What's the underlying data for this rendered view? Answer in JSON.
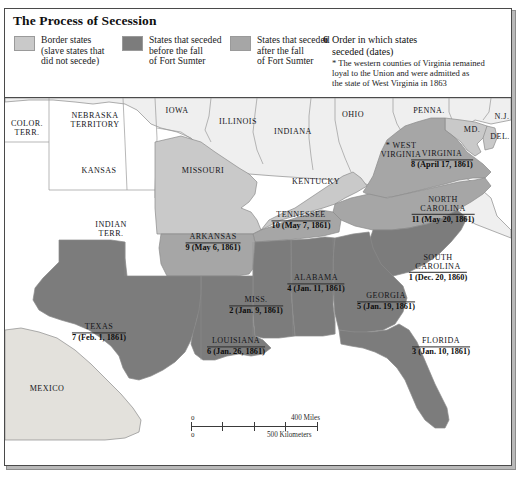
{
  "legend": {
    "title": "The Process of Secession",
    "items": [
      {
        "label": "Border states\n(slave states that\ndid not secede)",
        "color": "#c9c9c9",
        "swatch_name": "swatch-border-states"
      },
      {
        "label": "States that seceded\nbefore the fall\nof Fort Sumter",
        "color": "#7c7c7c",
        "swatch_name": "swatch-seceded-before"
      },
      {
        "label": "States that seceded\nafter the fall\nof Fort Sumter",
        "color": "#a6a6a6",
        "swatch_name": "swatch-seceded-after"
      }
    ],
    "note_number": "6",
    "note_text": "Order in which states\nseceded (dates)",
    "note_footnote": "* The western counties of Virginia remained\nloyal to the Union and were admitted as\nthe state of West Virginia in 1863"
  },
  "map": {
    "plain_labels": [
      {
        "name": "label-colorado-territory",
        "text": "COLOR.\nTERR.",
        "x": 22,
        "y": 30
      },
      {
        "name": "label-nebraska-territory",
        "text": "NEBRASKA\nTERRITORY",
        "x": 90,
        "y": 22
      },
      {
        "name": "label-kansas",
        "text": "KANSAS",
        "x": 94,
        "y": 73
      },
      {
        "name": "label-indian-territory",
        "text": "INDIAN\nTERR.",
        "x": 106,
        "y": 131
      },
      {
        "name": "label-iowa",
        "text": "IOWA",
        "x": 172,
        "y": 13
      },
      {
        "name": "label-illinois",
        "text": "ILLINOIS",
        "x": 233,
        "y": 24
      },
      {
        "name": "label-indiana",
        "text": "INDIANA",
        "x": 288,
        "y": 34
      },
      {
        "name": "label-ohio",
        "text": "OHIO",
        "x": 348,
        "y": 17
      },
      {
        "name": "label-pennsylvania",
        "text": "PENNA.",
        "x": 424,
        "y": 13
      },
      {
        "name": "label-new-jersey",
        "text": "N.J.",
        "x": 497,
        "y": 19
      },
      {
        "name": "label-maryland",
        "text": "MD.",
        "x": 467,
        "y": 32
      },
      {
        "name": "label-delaware",
        "text": "DEL.",
        "x": 495,
        "y": 39
      },
      {
        "name": "label-missouri",
        "text": "MISSOURI",
        "x": 198,
        "y": 73
      },
      {
        "name": "label-kentucky",
        "text": "KENTUCKY",
        "x": 311,
        "y": 84
      },
      {
        "name": "label-west-virginia",
        "text": "* WEST\nVIRGINIA",
        "x": 396,
        "y": 52
      },
      {
        "name": "label-mexico",
        "text": "MEXICO",
        "x": 42,
        "y": 291
      }
    ],
    "seceded_labels": [
      {
        "name": "label-virginia",
        "state": "VIRGINIA",
        "date": "8 (April 17, 1861)",
        "x": 437,
        "y": 62
      },
      {
        "name": "label-north-carolina",
        "state": "NORTH\nCAROLINA",
        "date": "11 (May 20, 1861)",
        "x": 438,
        "y": 112
      },
      {
        "name": "label-south-carolina",
        "state": "SOUTH\nCAROLINA",
        "date": "1 (Dec. 20, 1860)",
        "x": 433,
        "y": 170
      },
      {
        "name": "label-tennessee",
        "state": "TENNESSEE",
        "date": "10 (May 7, 1861)",
        "x": 296,
        "y": 123
      },
      {
        "name": "label-arkansas",
        "state": "ARKANSAS",
        "date": "9 (May 6, 1861)",
        "x": 208,
        "y": 145
      },
      {
        "name": "label-alabama",
        "state": "ALABAMA",
        "date": "4 (Jan. 11, 1861)",
        "x": 311,
        "y": 186
      },
      {
        "name": "label-georgia",
        "state": "GEORGIA",
        "date": "5 (Jan. 19, 1861)",
        "x": 381,
        "y": 204
      },
      {
        "name": "label-mississippi",
        "state": "MISS.",
        "date": "2 (Jan. 9, 1861)",
        "x": 251,
        "y": 208
      },
      {
        "name": "label-louisiana",
        "state": "LOUISIANA",
        "date": "6 (Jan. 26, 1861)",
        "x": 231,
        "y": 249
      },
      {
        "name": "label-texas",
        "state": "TEXAS",
        "date": "7 (Feb. 1, 1861)",
        "x": 94,
        "y": 235
      },
      {
        "name": "label-florida",
        "state": "FLORIDA",
        "date": "3 (Jan. 10, 1861)",
        "x": 436,
        "y": 249
      }
    ],
    "scale": {
      "miles_zero": "0",
      "miles_label": "400 Miles",
      "km_zero": "0",
      "km_label": "500 Kilometers"
    },
    "colors": {
      "union_free": "#efefef",
      "border_state": "#c9c9c9",
      "seceded_before": "#7c7c7c",
      "seceded_after": "#a6a6a6",
      "foreign": "#e3e1dc",
      "water": "#ffffff",
      "outline": "#8b8b8b"
    }
  }
}
